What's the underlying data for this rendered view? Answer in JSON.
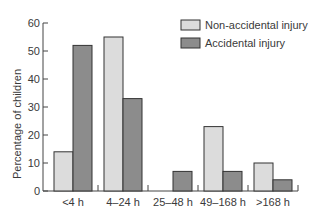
{
  "chart_data": {
    "type": "bar",
    "title": "",
    "xlabel": "",
    "ylabel": "Percentage of children",
    "ylim": [
      0,
      60
    ],
    "yticks": [
      0,
      10,
      20,
      30,
      40,
      50,
      60
    ],
    "grid": false,
    "legend_position": "top-right",
    "categories": [
      "<4 h",
      "4–24 h",
      "25–48 h",
      "49–168 h",
      ">168 h"
    ],
    "series": [
      {
        "name": "Non-accidental injury",
        "color": "#dcdcdc",
        "values": [
          14,
          55,
          0,
          23,
          10
        ]
      },
      {
        "name": "Accidental injury",
        "color": "#8c8c8c",
        "values": [
          52,
          33,
          7,
          7,
          4
        ]
      }
    ]
  },
  "colors": {
    "axis": "#444444",
    "bar_stroke": "#333333",
    "text": "#3a3a3a"
  }
}
